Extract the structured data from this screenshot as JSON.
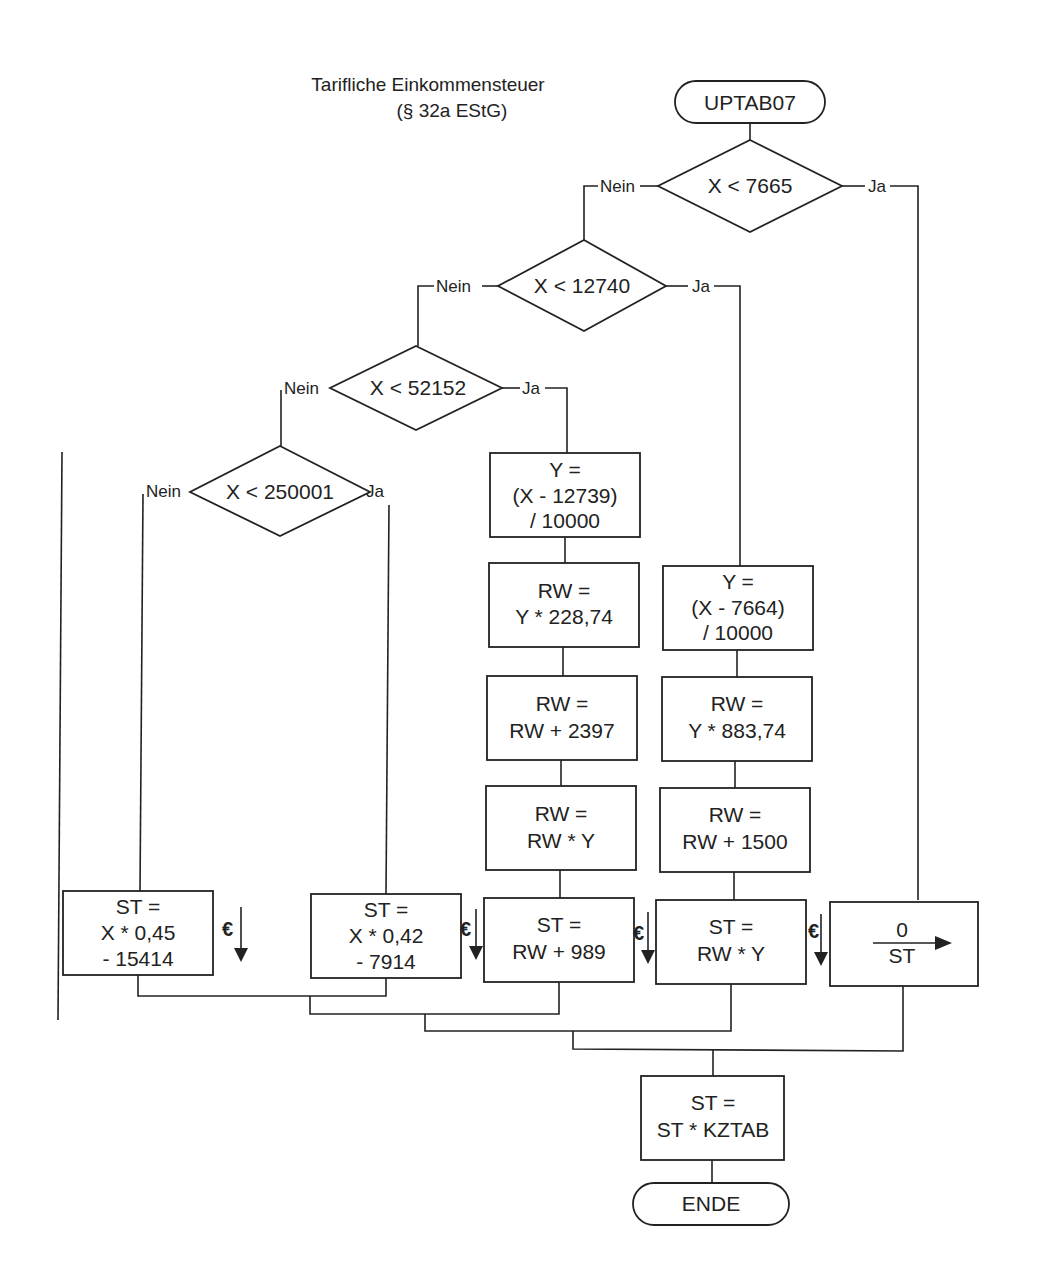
{
  "title": {
    "line1": "Tarifliche Einkommensteuer",
    "line2": "(§ 32a EStG)"
  },
  "start": {
    "label": "UPTAB07"
  },
  "end": {
    "label": "ENDE"
  },
  "decisions": [
    {
      "condition": "X < 7665",
      "no": "Nein",
      "yes": "Ja"
    },
    {
      "condition": "X < 12740",
      "no": "Nein",
      "yes": "Ja"
    },
    {
      "condition": "X < 52152",
      "no": "Nein",
      "yes": "Ja"
    },
    {
      "condition": "X < 250001",
      "no": "Nein",
      "yes": "Ja"
    }
  ],
  "branch_zone2": [
    {
      "lines": [
        "Y =",
        "(X - 12739)",
        "/ 10000"
      ]
    },
    {
      "lines": [
        "RW =",
        "Y * 228,74"
      ]
    },
    {
      "lines": [
        "RW =",
        "RW + 2397"
      ]
    },
    {
      "lines": [
        "RW =",
        "RW * Y"
      ]
    },
    {
      "lines": [
        "ST =",
        "RW + 989"
      ]
    }
  ],
  "branch_zone1": [
    {
      "lines": [
        "Y =",
        "(X - 7664)",
        "/ 10000"
      ]
    },
    {
      "lines": [
        "RW =",
        "Y * 883,74"
      ]
    },
    {
      "lines": [
        "RW =",
        "RW + 1500"
      ]
    },
    {
      "lines": [
        "ST =",
        "RW * Y"
      ]
    }
  ],
  "branch_zone4": {
    "lines": [
      "ST =",
      "X * 0,45",
      "- 15414"
    ]
  },
  "branch_zone3": {
    "lines": [
      "ST =",
      "X * 0,42",
      "- 7914"
    ]
  },
  "branch_zero": {
    "top": "0",
    "bottom": "ST"
  },
  "final_step": {
    "lines": [
      "ST =",
      "ST * KZTAB"
    ]
  },
  "rounding_symbol": "€"
}
